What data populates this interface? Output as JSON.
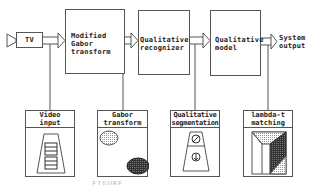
{
  "diagram": {
    "type": "block-diagram",
    "top_row": {
      "source": {
        "label": "TV"
      },
      "blocks": [
        {
          "id": "modified-gabor",
          "label_lines": [
            "Modified",
            "Gabor",
            "transform"
          ]
        },
        {
          "id": "qualitative-recognizer",
          "label_lines": [
            "Qualitative",
            "recognizer"
          ]
        },
        {
          "id": "qualitative-model",
          "label_lines": [
            "Qualitative",
            "model"
          ]
        }
      ],
      "output": {
        "label_lines": [
          "System",
          "output"
        ]
      }
    },
    "bottom_row": [
      {
        "id": "video-input",
        "header_lines": [
          "Video",
          "input"
        ],
        "illustration": "road-with-vehicles"
      },
      {
        "id": "gabor-transform",
        "header_lines": [
          "Gabor",
          "transform"
        ],
        "illustration": "light-and-dark-ellipses"
      },
      {
        "id": "qualitative-segmentation",
        "header_lines": [
          "Qualitative",
          "segmentation"
        ],
        "illustration": "segmented-trapezoid-symbols"
      },
      {
        "id": "lambda-t-matching",
        "header_lines": [
          "lambda-t",
          "matching"
        ],
        "illustration": "shaded-polygon-regions"
      }
    ],
    "edges": [
      {
        "from": "TV",
        "to": "Modified Gabor transform"
      },
      {
        "from": "Modified Gabor transform",
        "to": "Qualitative recognizer"
      },
      {
        "from": "Qualitative recognizer",
        "to": "Qualitative model"
      },
      {
        "from": "Qualitative model",
        "to": "System output"
      },
      {
        "from": "TV arrow",
        "to": "Video input",
        "style": "line"
      },
      {
        "from": "Gabor arrow",
        "to": "Gabor transform",
        "style": "line"
      },
      {
        "from": "Recognizer arrow",
        "to": "Qualitative segmentation",
        "style": "line"
      },
      {
        "from": "Model arrow",
        "to": "lambda-t matching",
        "style": "line"
      }
    ],
    "caption": "FIGURE"
  }
}
